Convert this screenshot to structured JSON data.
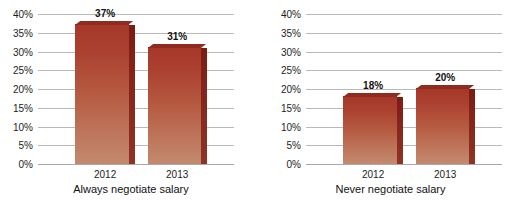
{
  "chart_data": [
    {
      "type": "bar",
      "title": "Always negotiate salary",
      "categories": [
        "2012",
        "2013"
      ],
      "values": [
        37,
        31
      ],
      "value_labels": [
        "37%",
        "31%"
      ],
      "xlabel": "Always negotiate salary",
      "ylabel": "",
      "ylim": [
        0,
        40
      ],
      "ytick_step": 5,
      "ytick_labels": [
        "0%",
        "5%",
        "10%",
        "15%",
        "20%",
        "25%",
        "30%",
        "35%",
        "40%"
      ],
      "grid": true,
      "legend": "none",
      "bar_style": "3d-extruded",
      "colors": {
        "bar_top": "#a6382a",
        "bar_bottom": "#c38a6f",
        "bar_side": "#7c1b14",
        "gridline": "#b9b9b9"
      }
    },
    {
      "type": "bar",
      "title": "Never negotiate salary",
      "categories": [
        "2012",
        "2013"
      ],
      "values": [
        18,
        20
      ],
      "value_labels": [
        "18%",
        "20%"
      ],
      "xlabel": "Never negotiate salary",
      "ylabel": "",
      "ylim": [
        0,
        40
      ],
      "ytick_step": 5,
      "ytick_labels": [
        "0%",
        "5%",
        "10%",
        "15%",
        "20%",
        "25%",
        "30%",
        "35%",
        "40%"
      ],
      "grid": true,
      "legend": "none",
      "bar_style": "3d-extruded",
      "colors": {
        "bar_top": "#a6382a",
        "bar_bottom": "#c38a6f",
        "bar_side": "#7c1b14",
        "gridline": "#b9b9b9"
      }
    }
  ],
  "figure": {
    "title_clipped": "",
    "panels": [
      {
        "caption": "Always negotiate salary"
      },
      {
        "caption": "Never negotiate salary"
      }
    ]
  }
}
